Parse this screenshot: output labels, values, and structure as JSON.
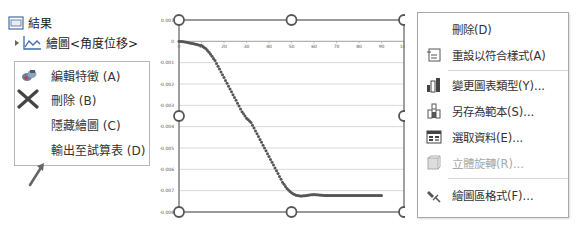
{
  "tree": {
    "results_label": "結果",
    "plot_label": "繪圖<角度位移>"
  },
  "left_menu": {
    "items": [
      {
        "label": "編輯特徵 (A)",
        "icon": "edit-feature-icon"
      },
      {
        "label": "刪除 (B)",
        "icon": "delete-x-icon"
      },
      {
        "label": "隱藏繪圖 (C)",
        "icon": ""
      },
      {
        "label": "輸出至試算表 (D)",
        "icon": ""
      }
    ]
  },
  "annotation": {
    "arrow": "pointer-arrow"
  },
  "chart_data": {
    "type": "scatter",
    "title": "",
    "xlabel": "",
    "ylabel": "",
    "x_ticks": [
      "0",
      "10",
      "20",
      "30",
      "40",
      "50",
      "60",
      "70",
      "80",
      "90",
      "100"
    ],
    "y_ticks": [
      "0.001",
      "0",
      "-0.001",
      "-0.002",
      "-0.003",
      "-0.004",
      "-0.005",
      "-0.006",
      "-0.007",
      "-0.008"
    ],
    "xlim": [
      0,
      100
    ],
    "ylim": [
      -0.008,
      0.001
    ],
    "grid": "horizontal",
    "series": [
      {
        "name": "角度位移",
        "color": "#555555",
        "x": [
          0,
          2,
          4,
          6,
          8,
          10,
          12,
          14,
          16,
          18,
          20,
          22,
          24,
          26,
          28,
          30,
          32,
          34,
          36,
          38,
          40,
          42,
          44,
          46,
          48,
          50,
          52,
          54,
          56,
          58,
          60,
          62,
          64,
          66,
          68,
          70,
          72,
          74,
          76,
          78,
          80,
          82,
          84,
          86,
          88,
          90
        ],
        "y": [
          0,
          -2e-05,
          -6e-05,
          -0.0001,
          -0.00015,
          -0.0002,
          -0.00035,
          -0.0006,
          -0.0009,
          -0.0013,
          -0.0017,
          -0.0021,
          -0.0025,
          -0.0029,
          -0.0033,
          -0.0036,
          -0.0038,
          -0.0042,
          -0.0046,
          -0.005,
          -0.0054,
          -0.0058,
          -0.0062,
          -0.0066,
          -0.0069,
          -0.0071,
          -0.00722,
          -0.00725,
          -0.00724,
          -0.0072,
          -0.00718,
          -0.0072,
          -0.00722,
          -0.00723,
          -0.00723,
          -0.00723,
          -0.00723,
          -0.00723,
          -0.00723,
          -0.00723,
          -0.00723,
          -0.00723,
          -0.00723,
          -0.00723,
          -0.00723,
          -0.00723
        ]
      }
    ]
  },
  "right_menu": {
    "items": [
      {
        "label": "刪除(D)",
        "icon": "",
        "disabled": false
      },
      {
        "label": "重設以符合樣式(A)",
        "icon": "reset-style-icon",
        "disabled": false
      },
      {
        "label": "變更圖表類型(Y)...",
        "icon": "chart-type-icon",
        "disabled": false
      },
      {
        "label": "另存為範本(S)...",
        "icon": "save-template-icon",
        "disabled": false
      },
      {
        "label": "選取資料(E)...",
        "icon": "select-data-icon",
        "disabled": false
      },
      {
        "label": "立體旋轉(R)...",
        "icon": "3d-rotation-icon",
        "disabled": true
      },
      {
        "label": "繪圖區格式(F)...",
        "icon": "format-plot-area-icon",
        "disabled": false
      }
    ]
  }
}
